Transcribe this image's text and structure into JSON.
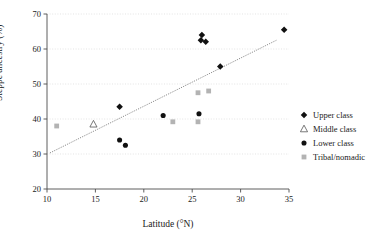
{
  "chart_data": {
    "type": "scatter",
    "title": "",
    "xlabel": "Latitude (°N)",
    "ylabel": "Steppe ancestry (%)",
    "xlim": [
      10,
      35
    ],
    "ylim": [
      20,
      70
    ],
    "xticks": [
      10,
      15,
      20,
      25,
      30,
      35
    ],
    "yticks": [
      20,
      30,
      40,
      50,
      60,
      70
    ],
    "grid": "horizontal-dotted",
    "legend_position": "right-outside",
    "series": [
      {
        "name": "Upper class",
        "marker": "filled-diamond",
        "color": "#111111",
        "points": [
          {
            "x": 17.5,
            "y": 43.5
          },
          {
            "x": 26.0,
            "y": 64.0
          },
          {
            "x": 25.9,
            "y": 62.5
          },
          {
            "x": 26.4,
            "y": 62.1
          },
          {
            "x": 27.9,
            "y": 55.0
          },
          {
            "x": 34.5,
            "y": 65.5
          }
        ]
      },
      {
        "name": "Middle class",
        "marker": "open-triangle",
        "color": "#555555",
        "points": [
          {
            "x": 14.8,
            "y": 38.5
          }
        ]
      },
      {
        "name": "Lower class",
        "marker": "filled-circle",
        "color": "#111111",
        "points": [
          {
            "x": 17.5,
            "y": 34.0
          },
          {
            "x": 18.1,
            "y": 32.5
          },
          {
            "x": 22.0,
            "y": 41.0
          },
          {
            "x": 25.7,
            "y": 41.5
          }
        ]
      },
      {
        "name": "Tribal/nomadic",
        "marker": "filled-square",
        "color": "#b3b3b3",
        "points": [
          {
            "x": 11.0,
            "y": 38.0
          },
          {
            "x": 23.0,
            "y": 39.2
          },
          {
            "x": 25.6,
            "y": 39.2
          },
          {
            "x": 25.6,
            "y": 47.5
          },
          {
            "x": 26.7,
            "y": 48.0
          }
        ]
      }
    ],
    "trendline": {
      "type": "dotted-linear-fit",
      "color": "#6e6e6e",
      "x_start": 10.3,
      "y_start": 30.3,
      "x_end": 33.7,
      "y_end": 62.5
    }
  },
  "legend": {
    "items": [
      {
        "label": "Upper class",
        "marker": "filled-diamond"
      },
      {
        "label": "Middle class",
        "marker": "open-triangle"
      },
      {
        "label": "Lower class",
        "marker": "filled-circle"
      },
      {
        "label": "Tribal/nomadic",
        "marker": "filled-square"
      }
    ]
  },
  "colors": {
    "axis": "#4d4d4d",
    "grid": "#d9d9d9",
    "marker_dark": "#111111",
    "marker_gray": "#b3b3b3",
    "trendline": "#6e6e6e",
    "background": "#ffffff"
  }
}
